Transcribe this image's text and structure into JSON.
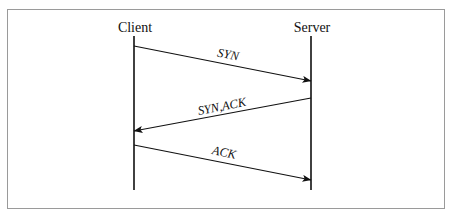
{
  "diagram": {
    "type": "sequence-diagram",
    "background_color": "#ffffff",
    "frame": {
      "border_color": "#9a9a9a",
      "x": 7,
      "y": 9,
      "width": 438,
      "height": 200
    },
    "line_color": "#111111",
    "participants": [
      {
        "id": "client",
        "label": "Client",
        "label_x": 135,
        "label_y": 20,
        "lifeline_x": 134,
        "lifeline_top": 36,
        "lifeline_bottom": 190
      },
      {
        "id": "server",
        "label": "Server",
        "label_x": 312,
        "label_y": 20,
        "lifeline_x": 311,
        "lifeline_top": 36,
        "lifeline_bottom": 190
      }
    ],
    "messages": [
      {
        "id": "syn",
        "label": "SYN",
        "from": "client",
        "to": "server",
        "direction": "right",
        "x1": 134,
        "y1": 46,
        "x2": 311,
        "y2": 81,
        "label_x": 228,
        "label_y": 55,
        "label_rotation": 11
      },
      {
        "id": "syn-ack",
        "label": "SYN,ACK",
        "from": "server",
        "to": "client",
        "direction": "left",
        "x1": 311,
        "y1": 98,
        "x2": 134,
        "y2": 131,
        "label_x": 222,
        "label_y": 107,
        "label_rotation": -11
      },
      {
        "id": "ack",
        "label": "ACK",
        "from": "client",
        "to": "server",
        "direction": "right",
        "x1": 134,
        "y1": 145,
        "x2": 311,
        "y2": 180,
        "label_x": 224,
        "label_y": 153,
        "label_rotation": 11
      }
    ]
  }
}
